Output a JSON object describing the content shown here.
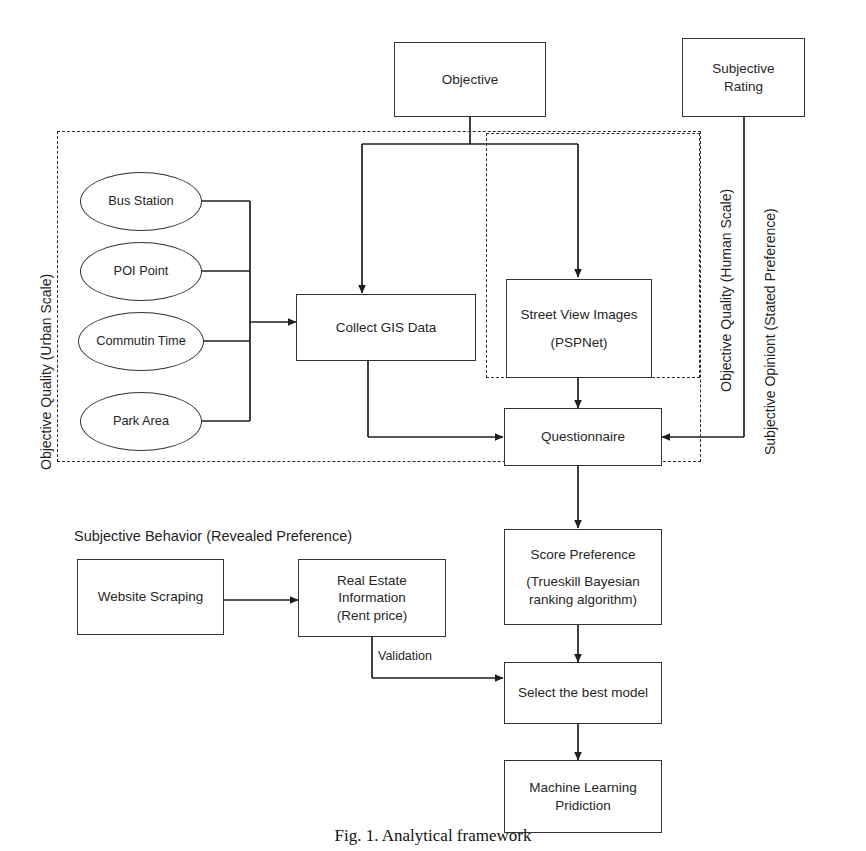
{
  "figure": {
    "caption": "Fig. 1. Analytical framework",
    "stroke_color": "#333333",
    "text_color": "#262626"
  },
  "groups": [
    {
      "id": "objective-quality-urban-scale",
      "label": "Objective Quality (Urban Scale)"
    },
    {
      "id": "objective-quality-human-scale",
      "label": "Objective Quality (Human Scale)"
    },
    {
      "id": "subjective-opiniont-stated-preference",
      "label": "Subjective Opiniont (Stated Preference)"
    }
  ],
  "section_labels": {
    "subjective_behavior": "Subjective Behavior (Revealed  Preference)"
  },
  "nodes": {
    "objective": {
      "label": "Objective"
    },
    "subjective_rating": {
      "line1": "Subjective",
      "line2": "Rating"
    },
    "bus_station": {
      "label": "Bus Station"
    },
    "poi_point": {
      "label": "POI Point"
    },
    "commutin_time": {
      "label": "Commutin Time"
    },
    "park_area": {
      "label": "Park Area"
    },
    "collect_gis_data": {
      "label": "Collect GIS Data"
    },
    "street_view_images": {
      "line1": "Street View Images",
      "line2": "(PSPNet)"
    },
    "questionnaire": {
      "label": "Questionnaire"
    },
    "score_preference": {
      "line1": "Score Preference",
      "line2": "(Trueskill Bayesian",
      "line3": "ranking algorithm)"
    },
    "select_best_model": {
      "label": "Select the best model"
    },
    "machine_learning_pridiction": {
      "line1": "Machine Learning",
      "line2": "Pridiction"
    },
    "website_scraping": {
      "label": "Website Scraping"
    },
    "real_estate_information": {
      "line1": "Real Estate",
      "line2": "Information",
      "line3": "(Rent price)"
    }
  },
  "edge_labels": {
    "validation": "Validation"
  }
}
